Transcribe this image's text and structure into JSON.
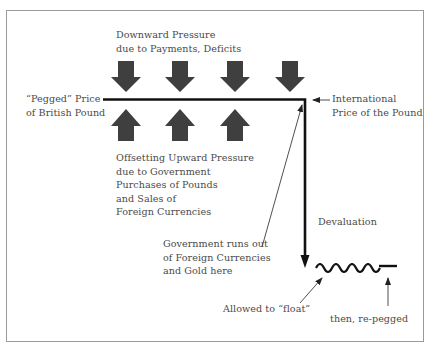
{
  "figure": {
    "labels": {
      "downward_pressure": [
        "Downward Pressure",
        "due to Payments, Deficits"
      ],
      "pegged_price": [
        "“Pegged” Price",
        "of British Pound"
      ],
      "international_price": [
        "International",
        "Price of the Pound"
      ],
      "upward_pressure": [
        "Offsetting Upward Pressure",
        "due to Government",
        "Purchases of Pounds",
        "and Sales of",
        "Foreign Currencies"
      ],
      "devaluation": "Devaluation",
      "government_runs_out": [
        "Government runs out",
        "of Foreign Currencies",
        "and Gold here"
      ],
      "allowed_to_float": "Allowed to “float”",
      "re_pegged": "then, re-pegged"
    },
    "arrows": {
      "downward_count": 4,
      "upward_count": 3
    },
    "colors": {
      "arrow_fill": "#3f3f3f",
      "line": "#111111",
      "text": "#4a4a4a",
      "frame": "#9a9a9a"
    }
  }
}
